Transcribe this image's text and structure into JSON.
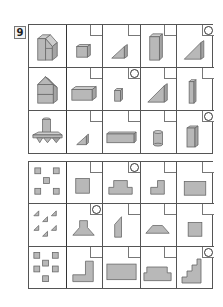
{
  "problem": {
    "number": "9"
  },
  "colors": {
    "shape_fill": "#b8b8b8",
    "grid_line": "#555555",
    "background": "#ffffff"
  },
  "top_grid": {
    "rows": [
      {
        "reference": "composite-solid-house-with-slanted-roof",
        "options": [
          {
            "shape": "cube",
            "marked": false
          },
          {
            "shape": "small-triangular-prism",
            "marked": false
          },
          {
            "shape": "tall-rectangular-prism",
            "marked": false
          },
          {
            "shape": "large-triangular-prism",
            "marked": true
          }
        ]
      },
      {
        "reference": "composite-solid-house-with-gable-roof",
        "options": [
          {
            "shape": "wide-rectangular-prism",
            "marked": false
          },
          {
            "shape": "small-rectangular-prism",
            "marked": true
          },
          {
            "shape": "large-triangular-prism",
            "marked": false
          },
          {
            "shape": "tall-thin-prism",
            "marked": false
          }
        ]
      },
      {
        "reference": "composite-solid-cylinder-on-triangular-prisms",
        "options": [
          {
            "shape": "small-triangular-prism",
            "marked": false
          },
          {
            "shape": "long-rectangular-prism",
            "marked": false
          },
          {
            "shape": "cylinder",
            "marked": false
          },
          {
            "shape": "tall-rectangular-prism",
            "marked": true
          }
        ]
      }
    ]
  },
  "bottom_grid": {
    "rows": [
      {
        "reference": "five-small-squares",
        "options": [
          {
            "shape": "square",
            "marked": false
          },
          {
            "shape": "stepped-trapezoid",
            "marked": true
          },
          {
            "shape": "l-shape",
            "marked": false
          },
          {
            "shape": "rectangle",
            "marked": false
          }
        ]
      },
      {
        "reference": "six-small-triangles",
        "options": [
          {
            "shape": "flared-pedestal",
            "marked": true
          },
          {
            "shape": "slanted-parallelogram",
            "marked": false
          },
          {
            "shape": "trapezoid",
            "marked": false
          },
          {
            "shape": "square",
            "marked": false
          }
        ]
      },
      {
        "reference": "six-small-squares",
        "options": [
          {
            "shape": "large-l-shape",
            "marked": false
          },
          {
            "shape": "wide-rectangle",
            "marked": false
          },
          {
            "shape": "stepped-platform",
            "marked": false
          },
          {
            "shape": "staircase",
            "marked": true
          }
        ]
      }
    ]
  }
}
